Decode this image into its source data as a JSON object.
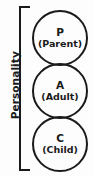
{
  "diagram": {
    "bracket_label": "Personality",
    "stroke_color": "#1a1a1a",
    "background_color": "#fdfdfd",
    "states": [
      {
        "letter": "P",
        "name": "(Parent)"
      },
      {
        "letter": "A",
        "name": "(Adult)"
      },
      {
        "letter": "C",
        "name": "(Child)"
      }
    ]
  }
}
